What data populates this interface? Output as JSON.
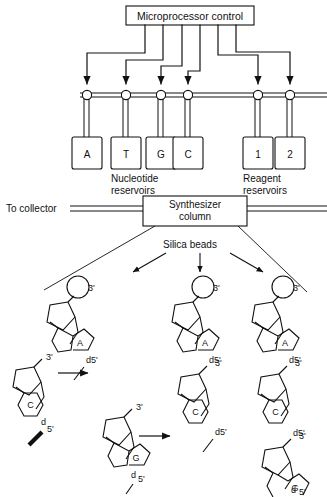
{
  "figure": {
    "stroke_color": "#111111",
    "background_color": "#ffffff"
  },
  "controller": {
    "label": "Microprocessor control"
  },
  "manifold": {
    "valve_count": 6,
    "to_collector_label": "To collector"
  },
  "reservoirs": {
    "nucleotide": {
      "group_label_line1": "Nucleotide",
      "group_label_line2": "reservoirs",
      "items": [
        {
          "label": "A"
        },
        {
          "label": "T"
        },
        {
          "label": "G"
        },
        {
          "label": "C"
        }
      ]
    },
    "reagent": {
      "group_label_line1": "Reagent",
      "group_label_line2": "reservoirs",
      "items": [
        {
          "label": "1"
        },
        {
          "label": "2"
        }
      ]
    }
  },
  "column": {
    "label_line1": "Synthesizer",
    "label_line2": "column"
  },
  "beads": {
    "label": "Silica beads",
    "arrow_count": 3
  },
  "chains": {
    "labels": {
      "three_prime": "3'",
      "five_prime": "d5'",
      "five_prime_split_d": "d",
      "five_prime_split_num": "5'"
    },
    "columns": [
      {
        "name": "left-chain",
        "units": [
          {
            "base": "A",
            "base_type": "purine"
          }
        ]
      },
      {
        "name": "middle-chain",
        "units": [
          {
            "base": "A",
            "base_type": "purine"
          },
          {
            "base": "C",
            "base_type": "pyrimidine"
          }
        ]
      },
      {
        "name": "right-chain",
        "units": [
          {
            "base": "A",
            "base_type": "purine"
          },
          {
            "base": "C",
            "base_type": "pyrimidine"
          },
          {
            "base": "G",
            "base_type": "purine"
          }
        ]
      }
    ]
  },
  "reagent_monomers": [
    {
      "name": "monomer-c",
      "base": "C",
      "base_type": "pyrimidine",
      "three_prime": "3'",
      "five_prime_d": "d",
      "five_prime_num": "5'",
      "activated": true
    },
    {
      "name": "monomer-g",
      "base": "G",
      "base_type": "purine",
      "three_prime": "3'",
      "five_prime_d": "d",
      "five_prime_num": "5'",
      "activated": false
    }
  ],
  "reaction_arrows": {
    "count": 2
  }
}
